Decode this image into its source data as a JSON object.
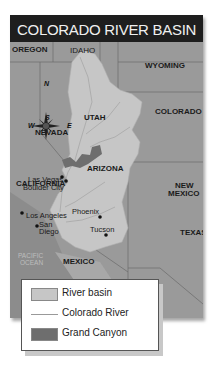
{
  "title": "COLORADO RIVER BASIN",
  "states": {
    "oregon": "OREGON",
    "idaho": "IDAHO",
    "wyoming": "WYOMING",
    "nevada": "NEVADA",
    "utah": "UTAH",
    "colorado": "COLORADO",
    "california": "CALIFORNIA",
    "arizona": "ARIZONA",
    "new_mexico_1": "NEW",
    "new_mexico_2": "MEXICO",
    "texas": "TEXAS",
    "mexico": "MEXICO"
  },
  "cities": [
    {
      "name": "Las Vegas"
    },
    {
      "name": "Boulder City"
    },
    {
      "name": "Los Angeles"
    },
    {
      "name": "San"
    },
    {
      "name": "Diego"
    },
    {
      "name": "Phoenix"
    },
    {
      "name": "Tucson"
    }
  ],
  "ocean": {
    "line1": "PACIFIC",
    "line2": "OCEAN"
  },
  "compass": {
    "n": "N",
    "s": "S",
    "e": "E",
    "w": "W"
  },
  "scale": {
    "miles_ticks": "0     100    200 miles",
    "km_ticks": "0  100  200 kilometers"
  },
  "legend": {
    "items": [
      {
        "label": "River basin",
        "color": "#c6c6c6"
      },
      {
        "label": "Colorado River",
        "color": "#9a9a9a"
      },
      {
        "label": "Grand Canyon",
        "color": "#6e6e6e"
      }
    ]
  },
  "colors": {
    "title_bg": "#1e1e1e",
    "land": "#9a9a9a",
    "basin": "#c6c6c6",
    "canyon": "#6e6e6e",
    "ocean": "#8a8a8a"
  }
}
